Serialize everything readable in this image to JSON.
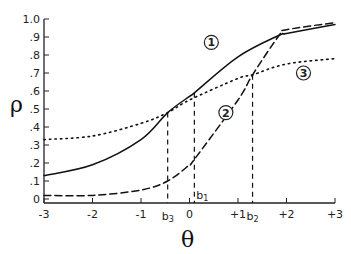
{
  "chart_data": {
    "type": "line",
    "title": "",
    "xlabel": "θ",
    "ylabel": "ρ",
    "xlim": [
      -3,
      3
    ],
    "ylim": [
      0,
      1.0
    ],
    "grid": false,
    "x_ticks": [
      "-3",
      "-2",
      "-1",
      "0",
      "+1",
      "+2",
      "+3"
    ],
    "y_ticks": [
      "0",
      ".1",
      ".2",
      ".3",
      ".4",
      ".5",
      ".6",
      ".7",
      ".8",
      ".9",
      "1.0"
    ],
    "series": [
      {
        "name": "1",
        "marker_label": "①",
        "style": "solid",
        "x": [
          -3,
          -2,
          -1,
          -0.45,
          0,
          0.1,
          1,
          1.85,
          2,
          3
        ],
        "values": [
          0.13,
          0.19,
          0.33,
          0.48,
          0.57,
          0.59,
          0.79,
          0.91,
          0.92,
          0.97
        ]
      },
      {
        "name": "2",
        "marker_label": "②",
        "style": "dashed",
        "x": [
          -3,
          -2,
          -1,
          -0.45,
          0,
          0.1,
          1,
          1.3,
          1.85,
          2,
          3
        ],
        "values": [
          0.02,
          0.02,
          0.05,
          0.1,
          0.19,
          0.22,
          0.55,
          0.69,
          0.91,
          0.94,
          0.98
        ]
      },
      {
        "name": "3",
        "marker_label": "③",
        "style": "dotted",
        "x": [
          -3,
          -2,
          -1,
          -0.45,
          0,
          1,
          1.3,
          2,
          3
        ],
        "values": [
          0.33,
          0.35,
          0.42,
          0.48,
          0.55,
          0.67,
          0.69,
          0.75,
          0.78
        ]
      }
    ],
    "annotations": [
      {
        "label": "b1",
        "x": 0.1,
        "y_top": 0.59,
        "style": "dashed"
      },
      {
        "label": "b2",
        "x": 1.3,
        "y_top": 0.69,
        "style": "dashed"
      },
      {
        "label": "b3",
        "x": -0.45,
        "y_top": 0.48,
        "style": "dashed"
      }
    ],
    "curve_labels": [
      {
        "text": "①",
        "x": 0.45,
        "y": 0.87
      },
      {
        "text": "②",
        "x": 0.75,
        "y": 0.48
      },
      {
        "text": "③",
        "x": 2.35,
        "y": 0.7
      }
    ]
  }
}
